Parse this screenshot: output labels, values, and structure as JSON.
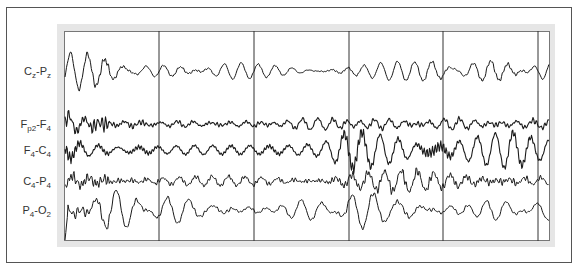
{
  "chart_data": {
    "type": "line",
    "title": "",
    "xlabel": "",
    "ylabel": "",
    "grid": false,
    "legend": "none",
    "x_divisions_px": [
      159,
      254,
      349,
      443,
      538
    ],
    "channels": [
      {
        "id": "cz-pz",
        "main": "C",
        "sub1": "z",
        "mid": "-P",
        "sub2": "z",
        "label_text": "Cz-Pz",
        "baseline_y": 71,
        "amp_by_segment": [
          13,
          9,
          6,
          8,
          16,
          12
        ],
        "freq": 0.36,
        "noise": 0.15
      },
      {
        "id": "fp2-f4",
        "main": "F",
        "sub1": "p2",
        "mid": "-F",
        "sub2": "4",
        "label_text": "Fp2-F4",
        "baseline_y": 124,
        "amp_by_segment": [
          7,
          4,
          4,
          5,
          5,
          6
        ],
        "freq": 0.42,
        "noise": 0.6
      },
      {
        "id": "f4-c4",
        "main": "F",
        "sub1": "4",
        "mid": "-C",
        "sub2": "4",
        "label_text": "F4-C4",
        "baseline_y": 150,
        "amp_by_segment": [
          8,
          5,
          7,
          18,
          14,
          8
        ],
        "freq": 0.33,
        "noise": 0.4
      },
      {
        "id": "c4-p4",
        "main": "C",
        "sub1": "4",
        "mid": "-P",
        "sub2": "4",
        "label_text": "C4-P4",
        "baseline_y": 181,
        "amp_by_segment": [
          10,
          8,
          8,
          17,
          14,
          8
        ],
        "freq": 0.34,
        "noise": 0.35
      },
      {
        "id": "p4-o2",
        "main": "P",
        "sub1": "4",
        "mid": "-O",
        "sub2": "2",
        "label_text": "P4-O2",
        "baseline_y": 210,
        "amp_by_segment": [
          14,
          12,
          8,
          15,
          9,
          8
        ],
        "freq": 0.3,
        "noise": 0.2
      }
    ],
    "trace_color": "#1a1a1a",
    "divider_color": "#333333"
  }
}
